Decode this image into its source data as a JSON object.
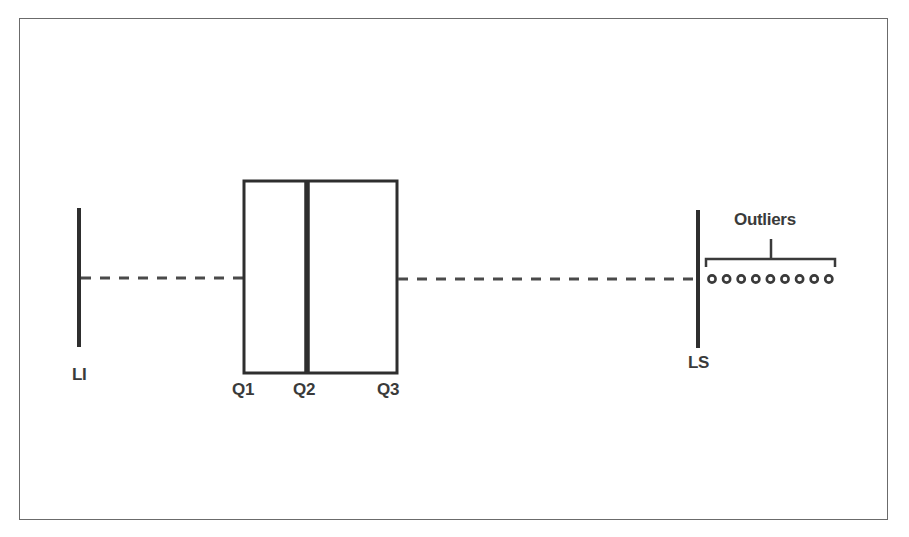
{
  "diagram": {
    "type": "box-plot-anatomy",
    "labels": {
      "lower_limit": "LI",
      "q1": "Q1",
      "q2": "Q2",
      "q3": "Q3",
      "upper_limit": "LS",
      "outliers": "Outliers"
    },
    "outlier_count": 9,
    "colors": {
      "stroke": "#2e2e2e",
      "dash": "#4a4a4a",
      "frame": "#6b6b6b",
      "text": "#3a3a3a",
      "background": "#ffffff"
    }
  }
}
